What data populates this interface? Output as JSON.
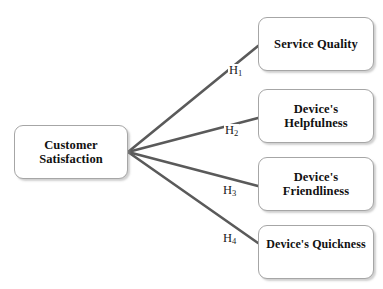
{
  "diagram": {
    "type": "path-model",
    "background_color": "#ffffff",
    "node_border_color": "#a6a6a6",
    "node_fill_color": "#ffffff",
    "edge_color": "#5a5a5a",
    "text_color": "#111111",
    "source_node": {
      "id": "customer-satisfaction",
      "label": "Customer\nSatisfaction"
    },
    "target_nodes": [
      {
        "id": "service-quality",
        "label": "Service Quality"
      },
      {
        "id": "devices-helpfulness",
        "label": "Device's\nHelpfulness"
      },
      {
        "id": "devices-friendliness",
        "label": "Device's\nFriendliness"
      },
      {
        "id": "devices-quickness",
        "label": "Device's Quickness"
      }
    ],
    "edges": [
      {
        "id": "h1",
        "hypothesis": "H",
        "subscript": "1",
        "from": "customer-satisfaction",
        "to": "service-quality"
      },
      {
        "id": "h2",
        "hypothesis": "H",
        "subscript": "2",
        "from": "customer-satisfaction",
        "to": "devices-helpfulness"
      },
      {
        "id": "h3",
        "hypothesis": "H",
        "subscript": "3",
        "from": "customer-satisfaction",
        "to": "devices-friendliness"
      },
      {
        "id": "h4",
        "hypothesis": "H",
        "subscript": "4",
        "from": "customer-satisfaction",
        "to": "devices-quickness"
      }
    ]
  }
}
